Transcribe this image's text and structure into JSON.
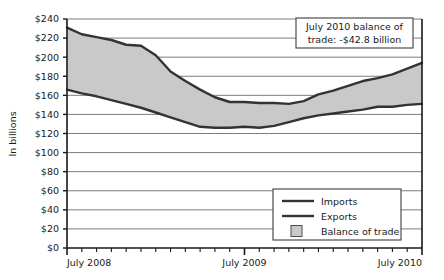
{
  "chart_data": {
    "type": "area",
    "title": "",
    "xlabel": "",
    "ylabel": "In billions",
    "ylim": [
      0,
      240
    ],
    "ytick_step": 20,
    "grid": true,
    "ytick_labels": [
      "$0",
      "$20",
      "$40",
      "$60",
      "$80",
      "$100",
      "$120",
      "$140",
      "$160",
      "$180",
      "$200",
      "$220",
      "$240"
    ],
    "ytick_values": [
      0,
      20,
      40,
      60,
      80,
      100,
      120,
      140,
      160,
      180,
      200,
      220,
      240
    ],
    "xtick_labels": [
      "July 2008",
      "July 2009",
      "July 2010"
    ],
    "xtick_positions": [
      0,
      12,
      24
    ],
    "x_minor_tick_count": 24,
    "x": [
      0,
      1,
      2,
      3,
      4,
      5,
      6,
      7,
      8,
      9,
      10,
      11,
      12,
      13,
      14,
      15,
      16,
      17,
      18,
      19,
      20,
      21,
      22,
      23,
      24
    ],
    "series": [
      {
        "name": "Imports",
        "color": "#333333",
        "values": [
          231,
          224,
          221,
          218,
          213,
          212,
          202,
          185,
          175,
          166,
          158,
          153,
          153,
          152,
          152,
          151,
          154,
          161,
          165,
          170,
          175,
          178,
          182,
          188,
          194
        ]
      },
      {
        "name": "Exports",
        "color": "#333333",
        "values": [
          166,
          162,
          159,
          155,
          151,
          147,
          142,
          137,
          132,
          127,
          126,
          126,
          127,
          126,
          128,
          132,
          136,
          139,
          141,
          143,
          145,
          148,
          148,
          150,
          151
        ]
      }
    ],
    "band": {
      "name": "Balance of trade",
      "fill": "#c9c9c9",
      "upper_series": "Imports",
      "lower_series": "Exports"
    },
    "legend": {
      "position": "bottom-right",
      "entries": [
        {
          "label": "Imports",
          "marker": "line"
        },
        {
          "label": "Exports",
          "marker": "line"
        },
        {
          "label": "Balance of trade",
          "marker": "swatch"
        }
      ]
    },
    "annotations": [
      {
        "id": "balance-note",
        "line1": "July 2010 balance of",
        "line2": "trade: -$42.8 billion",
        "position": "top-right"
      }
    ]
  },
  "colors": {
    "line": "#333333",
    "band_fill": "#c9c9c9",
    "grid": "#6e6e6e",
    "axis": "#1a1a1a",
    "box_border": "#4d4d4d",
    "background": "#ffffff"
  }
}
